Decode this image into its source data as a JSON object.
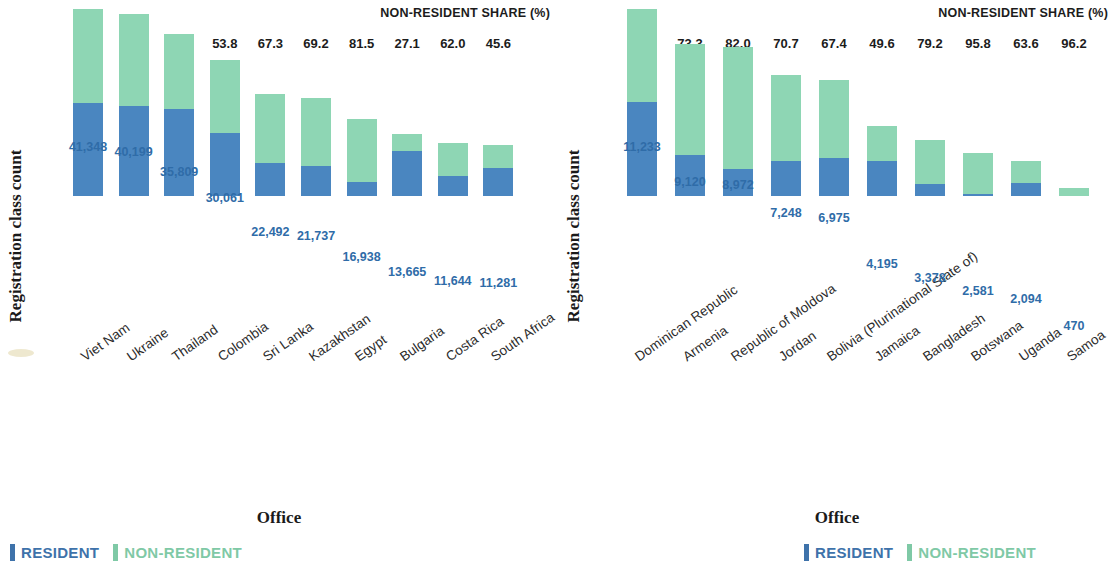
{
  "chart_data": [
    {
      "type": "bar",
      "subtype": "stacked-bar",
      "panel": "left",
      "title": "",
      "xlabel": "Office",
      "ylabel": "Registration class count",
      "ylim": [
        0,
        45000
      ],
      "grid": false,
      "legend_position": "bottom-left",
      "secondary_axis_title": "NON-RESIDENT SHARE (%)",
      "categories": [
        "Viet Nam",
        "Ukraine",
        "Thailand",
        "Colombia",
        "Sri Lanka",
        "Kazakhstan",
        "Egypt",
        "Bulgaria",
        "Costa Rica",
        "South Africa"
      ],
      "totals": [
        41348,
        40199,
        35809,
        30061,
        22492,
        21737,
        16938,
        13665,
        11644,
        11281
      ],
      "total_labels": [
        "41,348",
        "40,199",
        "35,809",
        "30,061",
        "22,492",
        "21,737",
        "16,938",
        "13,665",
        "11,644",
        "11,281"
      ],
      "nonresident_share": [
        50.5,
        50.7,
        46.0,
        53.8,
        67.3,
        69.2,
        81.5,
        27.1,
        62.0,
        45.6
      ],
      "share_labels": [
        "50.5",
        "50.7",
        "46.0",
        "53.8",
        "67.3",
        "69.2",
        "81.5",
        "27.1",
        "62.0",
        "45.6"
      ],
      "series": [
        {
          "name": "RESIDENT",
          "color": "#4a86c0",
          "values": [
            20467,
            19818,
            19337,
            13888,
            7355,
            6695,
            3134,
            9962,
            4425,
            6137
          ]
        },
        {
          "name": "NON-RESIDENT",
          "color": "#8ed6b4",
          "values": [
            20881,
            20381,
            16472,
            16173,
            15137,
            15042,
            13804,
            3703,
            7219,
            5144
          ]
        }
      ]
    },
    {
      "type": "bar",
      "subtype": "stacked-bar",
      "panel": "right",
      "title": "",
      "xlabel": "Office",
      "ylabel": "Registration class count",
      "ylim": [
        0,
        12500
      ],
      "grid": false,
      "legend_position": "bottom-left",
      "secondary_axis_title": "NON-RESIDENT SHARE (%)",
      "categories": [
        "Dominican Republic",
        "Armenia",
        "Republic of Moldova",
        "Jordan",
        "Bolivia (Plurinational State of)",
        "Jamaica",
        "Bangladesh",
        "Botswana",
        "Uganda",
        "Samoa"
      ],
      "totals": [
        11233,
        9120,
        8972,
        7248,
        6975,
        4195,
        3378,
        2581,
        2094,
        470
      ],
      "total_labels": [
        "11,233",
        "9,120",
        "8,972",
        "7,248",
        "6,975",
        "4,195",
        "3,378",
        "2,581",
        "2,094",
        "470"
      ],
      "nonresident_share": [
        49.7,
        73.3,
        82.0,
        70.7,
        67.4,
        49.6,
        79.2,
        95.8,
        63.6,
        96.2
      ],
      "share_labels": [
        "49.7",
        "73.3",
        "82.0",
        "70.7",
        "67.4",
        "49.6",
        "79.2",
        "95.8",
        "63.6",
        "96.2"
      ],
      "series": [
        {
          "name": "RESIDENT",
          "color": "#4a86c0",
          "values": [
            5650,
            2435,
            1615,
            2124,
            2274,
            2114,
            703,
            108,
            762,
            18
          ]
        },
        {
          "name": "NON-RESIDENT",
          "color": "#8ed6b4",
          "values": [
            5583,
            6685,
            7357,
            5124,
            4701,
            2081,
            2675,
            2473,
            1332,
            452
          ]
        }
      ]
    }
  ],
  "legend": {
    "resident_label": "RESIDENT",
    "nonresident_label": "NON-RESIDENT",
    "resident_color": "#3e72aa",
    "nonresident_color": "#7fc9a6"
  },
  "axis": {
    "y_title": "Registration class count",
    "x_title": "Office",
    "share_title": "NON-RESIDENT SHARE (%)"
  }
}
